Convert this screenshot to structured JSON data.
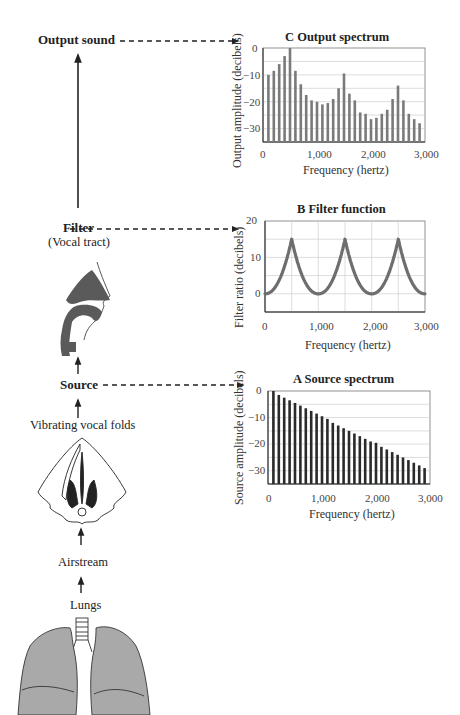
{
  "flow": {
    "output_sound": "Output sound",
    "filter": "Filter",
    "filter_sub": "(Vocal tract)",
    "source": "Source",
    "vibrating": "Vibrating vocal folds",
    "airstream": "Airstream",
    "lungs": "Lungs"
  },
  "colors": {
    "bar_output": "#7a7a7a",
    "bar_source": "#2a2a2a",
    "filter_curve": "#6e6e6e",
    "grid": "#cfcfcf",
    "lung_fill": "#a9a9a9",
    "vocal_tract_fill": "#5a5a5a"
  },
  "chart_data": [
    {
      "id": "C",
      "type": "bar",
      "title": "C   Output spectrum",
      "xlabel": "Frequency (hertz)",
      "ylabel": "Output amplitude (decibels)",
      "x": [
        100,
        200,
        300,
        400,
        500,
        600,
        700,
        800,
        900,
        1000,
        1100,
        1200,
        1300,
        1400,
        1500,
        1600,
        1700,
        1800,
        1900,
        2000,
        2100,
        2200,
        2300,
        2400,
        2500,
        2600,
        2700,
        2800,
        2900
      ],
      "values": [
        -10,
        -8.5,
        -6,
        -3,
        0,
        -8.5,
        -13.5,
        -17.5,
        -19.5,
        -20,
        -21,
        -20.5,
        -19,
        -15,
        -9.5,
        -17,
        -19.5,
        -24,
        -24.5,
        -26.5,
        -26,
        -24.5,
        -23,
        -19,
        -14,
        -19.5,
        -24.5,
        -26.5,
        -28
      ],
      "xticks": [
        "0",
        "1,000",
        "2,000",
        "3,000"
      ],
      "yticks": [
        "0",
        "−10",
        "−20",
        "−30"
      ],
      "xlim": [
        0,
        3000
      ],
      "ylim": [
        -35,
        0
      ],
      "grid": true
    },
    {
      "id": "B",
      "type": "line",
      "title": "B   Filter function",
      "xlabel": "Frequency (hertz)",
      "ylabel": "Filter ratio (decibels)",
      "x": [
        0,
        100,
        200,
        300,
        400,
        450,
        500,
        550,
        600,
        700,
        800,
        900,
        1000,
        1100,
        1200,
        1300,
        1400,
        1450,
        1500,
        1550,
        1600,
        1700,
        1800,
        1900,
        2000,
        2100,
        2200,
        2300,
        2400,
        2450,
        2500,
        2550,
        2600,
        2700,
        2800,
        2900,
        3000
      ],
      "values": [
        0,
        1,
        2.5,
        5,
        9.5,
        13.5,
        15,
        13.5,
        9.5,
        5,
        2.5,
        1,
        0,
        1,
        2.5,
        5,
        9.5,
        13.5,
        15,
        13.5,
        9.5,
        5,
        2.5,
        1,
        0,
        1,
        2.5,
        5,
        9.5,
        13.5,
        15,
        13.5,
        9.5,
        5,
        2.5,
        1,
        0
      ],
      "xticks": [
        "0",
        "1,000",
        "2,000",
        "3,000"
      ],
      "yticks": [
        "20",
        "10",
        "0"
      ],
      "xlim": [
        0,
        3000
      ],
      "ylim": [
        -5,
        20
      ],
      "grid": true
    },
    {
      "id": "A",
      "type": "bar",
      "title": "A   Source spectrum",
      "xlabel": "Frequency (hertz)",
      "ylabel": "Source amplitude (decibels)",
      "x": [
        100,
        200,
        300,
        400,
        500,
        600,
        700,
        800,
        900,
        1000,
        1100,
        1200,
        1300,
        1400,
        1500,
        1600,
        1700,
        1800,
        1900,
        2000,
        2100,
        2200,
        2300,
        2400,
        2500,
        2600,
        2700,
        2800,
        2900
      ],
      "values": [
        0,
        -1.5,
        -2.5,
        -3.5,
        -4.5,
        -5.5,
        -6.5,
        -7.5,
        -8.5,
        -9.5,
        -10.5,
        -12,
        -13,
        -14,
        -15,
        -16,
        -17,
        -18,
        -19,
        -19.5,
        -21,
        -22,
        -23,
        -24,
        -25,
        -26,
        -27,
        -28,
        -29
      ],
      "xticks": [
        "0",
        "1,000",
        "2,000",
        "3,000"
      ],
      "yticks": [
        "0",
        "−10",
        "−20",
        "−30"
      ],
      "xlim": [
        0,
        3000
      ],
      "ylim": [
        -35,
        0
      ],
      "grid": true
    }
  ]
}
